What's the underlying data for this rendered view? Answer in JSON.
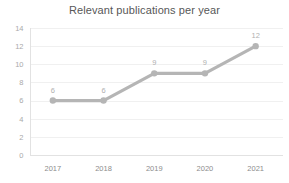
{
  "chart_data": {
    "type": "line",
    "title": "Relevant publications per year",
    "xlabel": "",
    "ylabel": "",
    "categories": [
      "2017",
      "2018",
      "2019",
      "2020",
      "2021"
    ],
    "values": [
      6,
      6,
      9,
      9,
      12
    ],
    "point_labels": [
      "6",
      "6",
      "9",
      "9",
      "12"
    ],
    "ylim": [
      0,
      14
    ],
    "ytick_labels": [
      "0",
      "2",
      "4",
      "6",
      "8",
      "10",
      "12",
      "14"
    ],
    "ytick_values": [
      0,
      2,
      4,
      6,
      8,
      10,
      12,
      14
    ],
    "grid": true,
    "legend": false,
    "series_color": "#b5b5b5",
    "marker_color": "#b5b5b5",
    "gridline_color": "#f0f0f0",
    "title_color": "#575757",
    "tick_label_color": "#a9a9a9",
    "data_label_color": "#b0b0b0"
  }
}
